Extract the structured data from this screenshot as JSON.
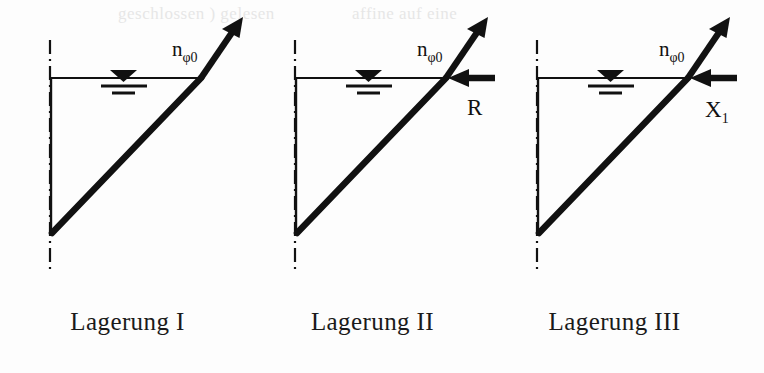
{
  "figure": {
    "ink_color": "#111111",
    "background_color": "#fdfdfd",
    "ghost_artifacts": [
      {
        "text": "geschlossen ) gelesen",
        "x": 118
      },
      {
        "text": "affine  auf eine",
        "x": 352
      }
    ]
  },
  "panels": [
    {
      "id": "lagerung-1",
      "caption": "Lagerung I",
      "normal_force_label": {
        "base": "n",
        "subscript": "φ0"
      },
      "horizontal_force_label": null,
      "has_horizontal_force": false,
      "groundwater_symbol": "water-table-triangle"
    },
    {
      "id": "lagerung-2",
      "caption": "Lagerung II",
      "normal_force_label": {
        "base": "n",
        "subscript": "φ0"
      },
      "horizontal_force_label": {
        "base": "R",
        "subscript": ""
      },
      "has_horizontal_force": true,
      "groundwater_symbol": "water-table-triangle"
    },
    {
      "id": "lagerung-3",
      "caption": "Lagerung III",
      "normal_force_label": {
        "base": "n",
        "subscript": "φ0"
      },
      "horizontal_force_label": {
        "base": "X",
        "subscript": "1"
      },
      "has_horizontal_force": true,
      "groundwater_symbol": "water-table-triangle"
    }
  ]
}
